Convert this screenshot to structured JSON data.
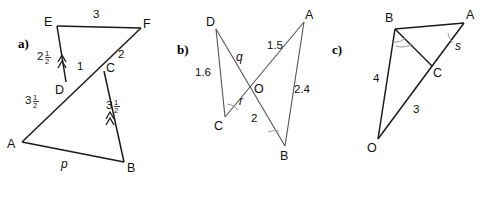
{
  "figure": {
    "background_color": "#ffffff",
    "line_color": "#1a1a1a",
    "thin_line_color": "#555555",
    "arc_color": "#9a9a9a"
  },
  "panels": [
    {
      "key": "a",
      "label": "a)",
      "description": "two-triangle hourglass EDF and ABC sharing transversal",
      "vertices": [
        {
          "name": "E",
          "label": "E",
          "x": 55,
          "y": 22
        },
        {
          "name": "F",
          "label": "F",
          "x": 143,
          "y": 24
        },
        {
          "name": "C",
          "label": "C",
          "x": 103,
          "y": 68
        },
        {
          "name": "D",
          "label": "D",
          "x": 62,
          "y": 85
        },
        {
          "name": "A",
          "label": "A",
          "x": 18,
          "y": 145
        },
        {
          "name": "B",
          "label": "B",
          "x": 122,
          "y": 168
        }
      ],
      "edge_labels": [
        {
          "name": "label-EF",
          "text": "3",
          "x": 96,
          "y": 18,
          "style": "len"
        },
        {
          "name": "label-CF",
          "text": "2",
          "x": 120,
          "y": 55,
          "style": "len"
        },
        {
          "name": "label-DC",
          "text": "1",
          "x": 78,
          "y": 68,
          "style": "len"
        },
        {
          "name": "label-ED",
          "whole": "2",
          "fraction": "1/2",
          "x": 42,
          "y": 57,
          "style": "frac"
        },
        {
          "name": "label-AD",
          "whole": "3",
          "fraction": "1/2",
          "x": 30,
          "y": 101,
          "style": "frac"
        },
        {
          "name": "label-CB",
          "whole": "3",
          "fraction": "1/2",
          "x": 110,
          "y": 106,
          "style": "frac"
        },
        {
          "name": "label-AB",
          "text": "p",
          "x": 63,
          "y": 164,
          "style": "ital"
        }
      ],
      "parallel_marks": [
        "segment-ED",
        "segment-CB"
      ]
    },
    {
      "key": "b",
      "label": "b)",
      "description": "crossed triangles DOC and AOB meeting at O",
      "vertices": [
        {
          "name": "D",
          "label": "D",
          "x": 213,
          "y": 25
        },
        {
          "name": "A",
          "label": "A",
          "x": 307,
          "y": 18
        },
        {
          "name": "O",
          "label": "O",
          "x": 252,
          "y": 89
        },
        {
          "name": "C",
          "label": "C",
          "x": 221,
          "y": 121
        },
        {
          "name": "B",
          "label": "B",
          "x": 283,
          "y": 150
        }
      ],
      "edge_labels": [
        {
          "name": "label-DC",
          "text": "1.6",
          "x": 202,
          "y": 73,
          "style": "len"
        },
        {
          "name": "label-DO",
          "text": "q",
          "x": 238,
          "y": 58,
          "style": "ital"
        },
        {
          "name": "label-OA",
          "text": "1.5",
          "x": 274,
          "y": 46,
          "style": "len"
        },
        {
          "name": "label-AB",
          "text": "2.4",
          "x": 298,
          "y": 90,
          "style": "len"
        },
        {
          "name": "label-OC",
          "text": "r",
          "x": 240,
          "y": 102,
          "style": "ital"
        },
        {
          "name": "label-OB",
          "text": "2",
          "x": 253,
          "y": 119,
          "style": "len"
        }
      ],
      "angle_arcs": [
        "angle-at-C",
        "angle-at-B"
      ]
    },
    {
      "key": "c",
      "label": "c)",
      "description": "triangle OBA with point C on OA and segment BC",
      "vertices": [
        {
          "name": "B",
          "label": "B",
          "x": 393,
          "y": 24
        },
        {
          "name": "A",
          "label": "A",
          "x": 468,
          "y": 18
        },
        {
          "name": "C",
          "label": "C",
          "x": 432,
          "y": 69
        },
        {
          "name": "O",
          "label": "O",
          "x": 375,
          "y": 143
        }
      ],
      "edge_labels": [
        {
          "name": "label-OB",
          "text": "4",
          "x": 378,
          "y": 78,
          "style": "len"
        },
        {
          "name": "label-OC",
          "text": "3",
          "x": 416,
          "y": 110,
          "style": "len"
        },
        {
          "name": "label-CA",
          "text": "s",
          "x": 457,
          "y": 47,
          "style": "ital"
        }
      ],
      "angle_arcs": [
        "angle-at-B",
        "angle-at-A"
      ]
    }
  ]
}
